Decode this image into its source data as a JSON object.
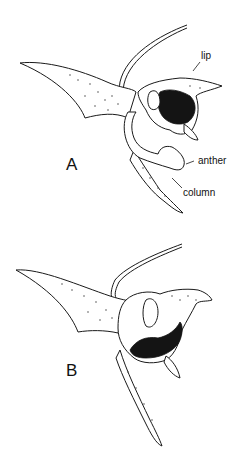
{
  "figure": {
    "panels": [
      {
        "id": "A",
        "letter": "A",
        "labels": {
          "lip": "lip",
          "anther": "anther",
          "column": "column"
        }
      },
      {
        "id": "B",
        "letter": "B"
      }
    ]
  }
}
